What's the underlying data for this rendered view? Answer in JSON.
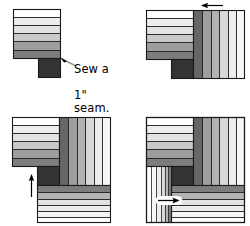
{
  "figure": {
    "type": "quilting-instruction-diagram",
    "panel_count": 4
  },
  "annotations": {
    "sew_seam": "Sew a\n1\" seam.",
    "sew_seam_line1": "Sew a",
    "sew_seam_line2": "1\" seam."
  },
  "palette": {
    "white": "#ffffff",
    "near_white": "#f6f6f6",
    "light1": "#ededed",
    "light2": "#e2e2e2",
    "light3": "#d8d8d8",
    "mid1": "#c9c9c9",
    "mid2": "#b3b3b3",
    "mid3": "#9e9e9e",
    "dark1": "#7d7d7d",
    "dark2": "#666666",
    "dark3": "#4a4a4a",
    "darkest": "#333333",
    "outline": "#1a1a1a",
    "arrow": "#000000"
  },
  "panels": [
    {
      "id": "panel-1",
      "step": 1,
      "label": "Step 1 - center square with first strip set",
      "has_arrow": false,
      "arrow_direction": null,
      "caption": "Sew a 1\" seam.",
      "strips_horizontal": [
        {
          "tone": "white",
          "width_units": 6
        },
        {
          "tone": "light1",
          "width_units": 6
        },
        {
          "tone": "light2",
          "width_units": 6
        },
        {
          "tone": "mid1",
          "width_units": 6
        },
        {
          "tone": "mid3",
          "width_units": 7
        },
        {
          "tone": "dark1",
          "width_units": 6
        }
      ],
      "center_square_tone": "darkest"
    },
    {
      "id": "panel-2",
      "step": 2,
      "label": "Step 2 - vertical strip set added on right",
      "has_arrow": true,
      "arrow_direction": "left",
      "caption": null,
      "strips_vertical": [
        {
          "tone": "dark2"
        },
        {
          "tone": "mid3"
        },
        {
          "tone": "mid2"
        },
        {
          "tone": "light3"
        },
        {
          "tone": "light1"
        },
        {
          "tone": "near_white"
        }
      ]
    },
    {
      "id": "panel-3",
      "step": 3,
      "label": "Step 3 - horizontal strip set added at bottom",
      "has_arrow": true,
      "arrow_direction": "down",
      "caption": null,
      "strips_bottom": [
        {
          "tone": "dark1"
        },
        {
          "tone": "mid2"
        },
        {
          "tone": "light2"
        },
        {
          "tone": "light1"
        },
        {
          "tone": "near_white"
        },
        {
          "tone": "white"
        }
      ]
    },
    {
      "id": "panel-4",
      "step": 4,
      "label": "Step 4 - completed log cabin block",
      "has_arrow": true,
      "arrow_direction": "right",
      "caption": null,
      "strips_left": [
        {
          "tone": "white"
        },
        {
          "tone": "near_white"
        },
        {
          "tone": "light1"
        },
        {
          "tone": "light3"
        },
        {
          "tone": "mid2"
        },
        {
          "tone": "dark1"
        }
      ]
    }
  ]
}
